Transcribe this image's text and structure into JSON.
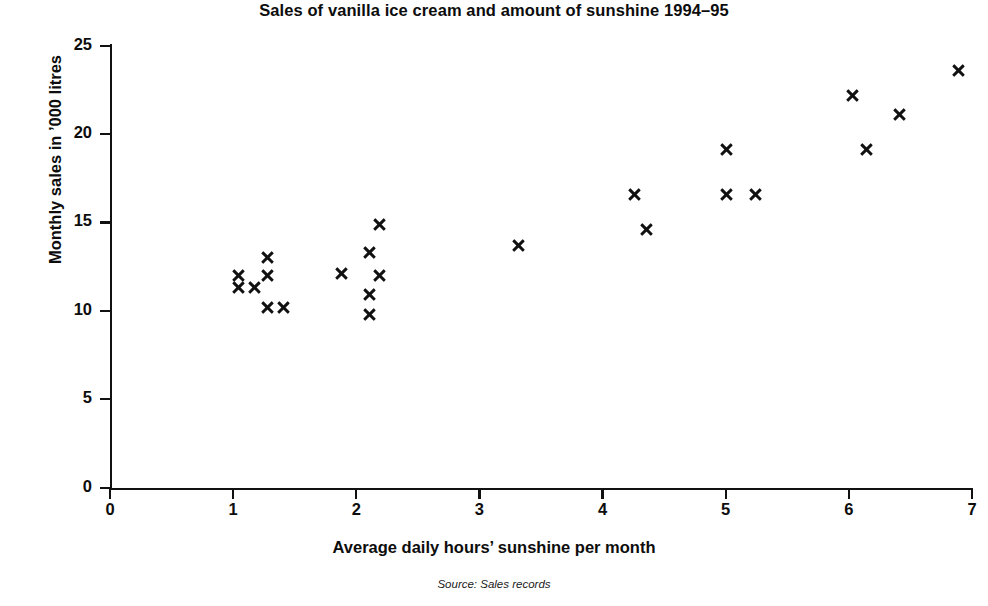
{
  "chart_data": {
    "type": "scatter",
    "title": "Sales of vanilla ice cream and amount of sunshine 1994–95",
    "xlabel": "Average daily hours’ sunshine per month",
    "ylabel": "Monthly sales in ’000 litres",
    "source": "Source: Sales records",
    "xlim": [
      0,
      7
    ],
    "ylim": [
      0,
      25
    ],
    "xticks": [
      "0",
      "1",
      "2",
      "3",
      "4",
      "5",
      "6",
      "7"
    ],
    "yticks": [
      "0",
      "5",
      "10",
      "15",
      "20",
      "25"
    ],
    "grid": false,
    "legend": null,
    "marker": "x-cross",
    "marker_color": "#111111",
    "series": [
      {
        "name": "Monthly sales vs sunshine",
        "points": [
          {
            "x": 1.04,
            "y": 12.0
          },
          {
            "x": 1.04,
            "y": 11.3
          },
          {
            "x": 1.17,
            "y": 11.3
          },
          {
            "x": 1.28,
            "y": 13.0
          },
          {
            "x": 1.28,
            "y": 12.0
          },
          {
            "x": 1.28,
            "y": 10.2
          },
          {
            "x": 1.41,
            "y": 10.2
          },
          {
            "x": 1.88,
            "y": 12.1
          },
          {
            "x": 2.11,
            "y": 13.3
          },
          {
            "x": 2.11,
            "y": 10.9
          },
          {
            "x": 2.11,
            "y": 9.8
          },
          {
            "x": 2.19,
            "y": 14.9
          },
          {
            "x": 2.19,
            "y": 12.0
          },
          {
            "x": 3.32,
            "y": 13.7
          },
          {
            "x": 4.26,
            "y": 16.6
          },
          {
            "x": 4.36,
            "y": 14.6
          },
          {
            "x": 5.01,
            "y": 19.1
          },
          {
            "x": 5.01,
            "y": 16.6
          },
          {
            "x": 5.24,
            "y": 16.6
          },
          {
            "x": 6.03,
            "y": 22.2
          },
          {
            "x": 6.14,
            "y": 19.1
          },
          {
            "x": 6.41,
            "y": 21.1
          },
          {
            "x": 6.89,
            "y": 23.6
          }
        ]
      }
    ]
  }
}
